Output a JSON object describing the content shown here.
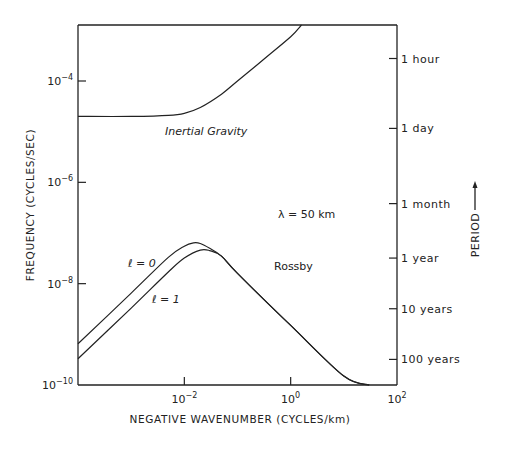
{
  "chart_data": {
    "type": "line",
    "title": "",
    "xlabel": "NEGATIVE WAVENUMBER (CYCLES/km)",
    "ylabel": "FREQUENCY (CYCLES/SEC)",
    "y2label": "PERIOD",
    "xscale": "log",
    "yscale": "log",
    "xlim": [
      0.0001,
      100
    ],
    "ylim": [
      1e-10,
      0.0013
    ],
    "grid": false,
    "legend": null,
    "x_ticks": [
      {
        "value": 0.01,
        "base": "10",
        "exp": "−2"
      },
      {
        "value": 1,
        "base": "10",
        "exp": "0"
      },
      {
        "value": 100,
        "base": "10",
        "exp": "2"
      }
    ],
    "y_ticks": [
      {
        "value": 0.0001,
        "base": "10",
        "exp": "−4"
      },
      {
        "value": 1e-06,
        "base": "10",
        "exp": "−6"
      },
      {
        "value": 1e-08,
        "base": "10",
        "exp": "−8"
      },
      {
        "value": 1e-10,
        "base": "10",
        "exp": "−10"
      }
    ],
    "y2_ticks": [
      {
        "label": "1 hour",
        "freq": 0.000278
      },
      {
        "label": "1 day",
        "freq": 1.16e-05
      },
      {
        "label": "1 month",
        "freq": 3.8e-07
      },
      {
        "label": "1 year",
        "freq": 3.2e-08
      },
      {
        "label": "10 years",
        "freq": 3.2e-09
      },
      {
        "label": "100 years",
        "freq": 3.2e-10
      }
    ],
    "series": [
      {
        "name": "Inertial Gravity",
        "x": [
          0.0001,
          0.001,
          0.005,
          0.01,
          0.02,
          0.05,
          0.1,
          0.3,
          1.0,
          1.6
        ],
        "y": [
          2e-05,
          2e-05,
          2.1e-05,
          2.3e-05,
          3e-05,
          5.5e-05,
          0.0001,
          0.00026,
          0.00075,
          0.0013
        ]
      },
      {
        "name": "Rossby l=0",
        "x": [
          0.0001,
          0.001,
          0.005,
          0.01,
          0.015,
          0.02,
          0.03,
          0.05,
          0.1,
          1.0,
          10.0,
          30.0
        ],
        "y": [
          6.5e-10,
          6.5e-09,
          3.3e-08,
          5.5e-08,
          6.4e-08,
          6.2e-08,
          5e-08,
          3.5e-08,
          1.6e-08,
          1.5e-09,
          1.5e-10,
          1e-10
        ]
      },
      {
        "name": "Rossby l=1",
        "x": [
          0.0001,
          0.001,
          0.005,
          0.01,
          0.02,
          0.03,
          0.05,
          0.1,
          1.0,
          10.0,
          30.0
        ],
        "y": [
          3.3e-10,
          3.3e-09,
          1.7e-08,
          3.2e-08,
          4.6e-08,
          4.5e-08,
          3.5e-08,
          1.6e-08,
          1.5e-09,
          1.5e-10,
          1e-10
        ]
      }
    ],
    "annotations": [
      {
        "text": "Inertial Gravity",
        "style": "italic"
      },
      {
        "text": "λ = 50 km"
      },
      {
        "text": "ℓ = 0"
      },
      {
        "text": "ℓ = 1"
      },
      {
        "text": "Rossby"
      }
    ]
  },
  "labels": {
    "xlabel": "NEGATIVE WAVENUMBER  (CYCLES/km)",
    "ylabel": "FREQUENCY  (CYCLES/SEC)",
    "y2label": "PERIOD",
    "inertial_gravity": "Inertial Gravity",
    "lambda": "λ = 50 km",
    "l0": "ℓ = 0",
    "l1": "ℓ = 1",
    "rossby": "Rossby"
  }
}
